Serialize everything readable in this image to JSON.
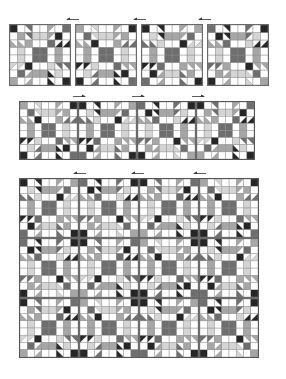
{
  "colors": {
    "white": "#ffffff",
    "light": "#d4d4d4",
    "mid": "#a6a6a6",
    "dark": "#6e6e6e",
    "black": "#262626",
    "grid": "#8a8a8a",
    "border": "#555555",
    "arrow": "#333333"
  },
  "block_pattern": {
    "grid": 8,
    "cells": [
      [
        "K",
        "W",
        "T1",
        "W",
        "W",
        "T2",
        "W",
        "D"
      ],
      [
        "W",
        "M",
        "T1",
        "L",
        "L",
        "T2",
        "K",
        "W"
      ],
      [
        "T3",
        "T3",
        "M",
        "W",
        "W",
        "D",
        "T4",
        "T4"
      ],
      [
        "W",
        "L",
        "W",
        "D",
        "D",
        "W",
        "M",
        "W"
      ],
      [
        "W",
        "L",
        "W",
        "D",
        "D",
        "W",
        "M",
        "W"
      ],
      [
        "T5",
        "T5",
        "K",
        "W",
        "W",
        "L",
        "T6",
        "T6"
      ],
      [
        "W",
        "D",
        "T7",
        "M",
        "M",
        "T8",
        "L",
        "W"
      ],
      [
        "M",
        "W",
        "T7",
        "W",
        "W",
        "T8",
        "W",
        "K"
      ]
    ],
    "triangles": {
      "T1": {
        "corner": "tr",
        "fill": "dark"
      },
      "T2": {
        "corner": "tl",
        "fill": "mid"
      },
      "T3": {
        "corner": "bl",
        "fill": "mid"
      },
      "T4": {
        "corner": "br",
        "fill": "black"
      },
      "T5": {
        "corner": "tl",
        "fill": "light"
      },
      "T6": {
        "corner": "tr",
        "fill": "dark"
      },
      "T7": {
        "corner": "br",
        "fill": "mid"
      },
      "T8": {
        "corner": "bl",
        "fill": "black"
      }
    },
    "fills": {
      "W": "white",
      "L": "light",
      "M": "mid",
      "D": "dark",
      "K": "black"
    }
  },
  "sections": [
    {
      "name": "separate-blocks",
      "x": 9,
      "y": 24,
      "block_size": 62,
      "gap": 4,
      "rows": 1,
      "cols": 4,
      "arrows": [
        {
          "x": 66,
          "y": 17,
          "w": 14,
          "direction": "left"
        },
        {
          "x": 133,
          "y": 17,
          "w": 14,
          "direction": "left"
        },
        {
          "x": 198,
          "y": 17,
          "w": 14,
          "direction": "left"
        }
      ]
    },
    {
      "name": "joined-row",
      "x": 19,
      "y": 101,
      "block_size": 59,
      "gap": 0,
      "rows": 1,
      "cols": 4,
      "arrows": [
        {
          "x": 72,
          "y": 94,
          "w": 14,
          "direction": "right"
        },
        {
          "x": 131,
          "y": 94,
          "w": 14,
          "direction": "right"
        },
        {
          "x": 191,
          "y": 94,
          "w": 14,
          "direction": "right"
        }
      ]
    },
    {
      "name": "assembled-quilt",
      "x": 19,
      "y": 178,
      "block_size": 60,
      "gap": 0,
      "rows": 3,
      "cols": 4,
      "arrows": [
        {
          "x": 73,
          "y": 171,
          "w": 14,
          "direction": "left"
        },
        {
          "x": 131,
          "y": 171,
          "w": 14,
          "direction": "left"
        },
        {
          "x": 193,
          "y": 171,
          "w": 14,
          "direction": "left"
        }
      ]
    }
  ]
}
